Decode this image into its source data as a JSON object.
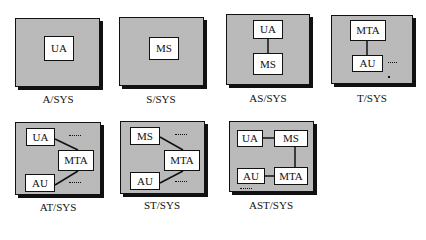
{
  "diagrams": [
    {
      "id": "a-sys",
      "label": "A/SYS",
      "components": [
        "UA"
      ]
    },
    {
      "id": "s-sys",
      "label": "S/SYS",
      "components": [
        "MS"
      ]
    },
    {
      "id": "as-sys",
      "label": "AS/SYS",
      "components": [
        "UA",
        "MS"
      ]
    },
    {
      "id": "t-sys",
      "label": "T/SYS",
      "components": [
        "MTA",
        "AU"
      ]
    },
    {
      "id": "at-sys",
      "label": "AT/SYS",
      "components": [
        "UA",
        "MTA",
        "AU"
      ]
    },
    {
      "id": "st-sys",
      "label": "ST/SYS",
      "components": [
        "MS",
        "MTA",
        "AU"
      ]
    },
    {
      "id": "ast-sys",
      "label": "AST/SYS",
      "components": [
        "UA",
        "MS",
        "AU",
        "MTA"
      ]
    }
  ],
  "colors": {
    "line": "#111111",
    "panel": "#d4d4d4",
    "box": "#ffffff"
  }
}
